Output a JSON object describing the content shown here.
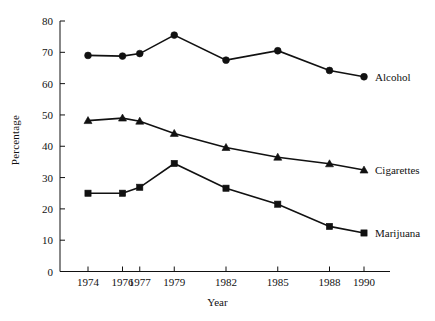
{
  "chart_data": {
    "type": "line",
    "title": "",
    "xlabel": "Year",
    "ylabel": "Percentage",
    "x": [
      1974,
      1976,
      1977,
      1979,
      1982,
      1985,
      1988,
      1990
    ],
    "categories": [
      "1974",
      "1976",
      "1977",
      "1979",
      "1982",
      "1985",
      "1988",
      "1990"
    ],
    "xlim": [
      1973,
      1991
    ],
    "ylim": [
      0,
      80
    ],
    "ytick_labels": [
      "0",
      "10",
      "20",
      "30",
      "40",
      "50",
      "60",
      "70",
      "80"
    ],
    "yticks": [
      0,
      10,
      20,
      30,
      40,
      50,
      60,
      70,
      80
    ],
    "grid": false,
    "legend_position": "right-of-line-end",
    "series": [
      {
        "name": "Alcohol",
        "marker": "circle",
        "color": "#111111",
        "values": [
          69,
          68.8,
          69.6,
          75.5,
          67.5,
          70.5,
          64.2,
          62.2
        ]
      },
      {
        "name": "Cigarettes",
        "marker": "triangle",
        "color": "#111111",
        "values": [
          48.2,
          49,
          48,
          44.1,
          39.6,
          36.5,
          34.4,
          32.4
        ]
      },
      {
        "name": "Marijuana",
        "marker": "square",
        "color": "#111111",
        "values": [
          25,
          25,
          26.9,
          34.5,
          26.6,
          21.5,
          14.4,
          12.3
        ]
      }
    ]
  },
  "axis": {
    "y_title": "Percentage",
    "x_title": "Year"
  },
  "legend": {
    "alcohol": "Alcohol",
    "cigarettes": "Cigarettes",
    "marijuana": "Marijuana"
  },
  "caption": ""
}
